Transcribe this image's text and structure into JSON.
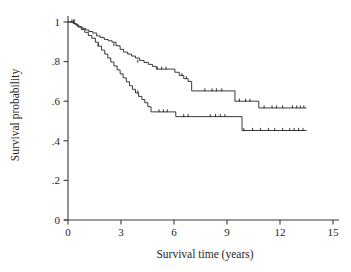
{
  "chart_data": {
    "type": "line",
    "subtype": "kaplan-meier-survival-step",
    "title": "",
    "xlabel": "Survival time (years)",
    "ylabel": "Survival probability",
    "xlim": [
      0,
      15
    ],
    "ylim": [
      0,
      1.05
    ],
    "xticks": [
      0,
      3,
      6,
      9,
      12,
      15
    ],
    "xtick_labels": [
      "0",
      "3",
      "6",
      "9",
      "12",
      "15"
    ],
    "yticks": [
      0,
      0.2,
      0.4,
      0.6,
      0.8,
      1
    ],
    "ytick_labels": [
      "0",
      ".2",
      ".4",
      ".6",
      ".8",
      "1"
    ],
    "grid": false,
    "legend": "none",
    "series": [
      {
        "name": "upper-curve",
        "step": "post",
        "x": [
          0,
          0.3,
          0.45,
          0.62,
          0.8,
          1.0,
          1.18,
          1.4,
          1.62,
          1.82,
          2.05,
          2.28,
          2.5,
          2.72,
          2.95,
          3.15,
          3.38,
          3.6,
          3.82,
          4.05,
          4.3,
          4.55,
          4.78,
          5.0,
          5.8,
          6.05,
          6.3,
          6.55,
          6.8,
          7.0,
          9.2,
          9.45,
          10.8,
          13.5
        ],
        "y": [
          1.0,
          0.992,
          0.984,
          0.976,
          0.968,
          0.96,
          0.952,
          0.944,
          0.93,
          0.922,
          0.912,
          0.905,
          0.898,
          0.88,
          0.862,
          0.848,
          0.838,
          0.828,
          0.818,
          0.806,
          0.796,
          0.786,
          0.776,
          0.762,
          0.762,
          0.746,
          0.73,
          0.714,
          0.7,
          0.652,
          0.652,
          0.6,
          0.566,
          0.566
        ],
        "censor_x": [
          0.22,
          0.3,
          0.38,
          2.6,
          3.95,
          5.05,
          5.3,
          5.55,
          6.45,
          6.7,
          7.75,
          8.15,
          8.4,
          8.7,
          9.7,
          10.05,
          10.3,
          11.1,
          11.55,
          11.8,
          12.15,
          12.7,
          12.95,
          13.15,
          13.35
        ],
        "censor_y": [
          1.0,
          1.0,
          1.0,
          0.88,
          0.796,
          0.762,
          0.762,
          0.762,
          0.73,
          0.714,
          0.652,
          0.652,
          0.652,
          0.652,
          0.6,
          0.6,
          0.6,
          0.566,
          0.566,
          0.566,
          0.566,
          0.566,
          0.566,
          0.566,
          0.566
        ]
      },
      {
        "name": "lower-curve",
        "step": "post",
        "x": [
          0,
          0.35,
          0.55,
          0.75,
          0.95,
          1.15,
          1.35,
          1.55,
          1.72,
          1.9,
          2.08,
          2.25,
          2.42,
          2.6,
          2.78,
          2.95,
          3.12,
          3.3,
          3.48,
          3.65,
          3.82,
          4.0,
          4.18,
          4.35,
          4.52,
          4.7,
          5.9,
          6.1,
          9.6,
          9.85,
          13.5
        ],
        "y": [
          1.0,
          0.99,
          0.975,
          0.962,
          0.948,
          0.932,
          0.918,
          0.898,
          0.878,
          0.858,
          0.838,
          0.818,
          0.798,
          0.778,
          0.758,
          0.738,
          0.718,
          0.698,
          0.678,
          0.66,
          0.642,
          0.624,
          0.608,
          0.592,
          0.572,
          0.546,
          0.546,
          0.522,
          0.522,
          0.452,
          0.452
        ],
        "censor_x": [
          1.7,
          3.95,
          5.15,
          5.4,
          5.62,
          6.55,
          6.8,
          8.05,
          8.35,
          8.62,
          8.88,
          9.95,
          10.45,
          10.9,
          11.35,
          11.7,
          12.15,
          12.55,
          12.8,
          13.05,
          13.3
        ],
        "censor_y": [
          0.878,
          0.642,
          0.546,
          0.546,
          0.546,
          0.522,
          0.522,
          0.522,
          0.522,
          0.522,
          0.522,
          0.452,
          0.452,
          0.452,
          0.452,
          0.452,
          0.452,
          0.452,
          0.452,
          0.452,
          0.452
        ]
      }
    ],
    "annotations": []
  }
}
